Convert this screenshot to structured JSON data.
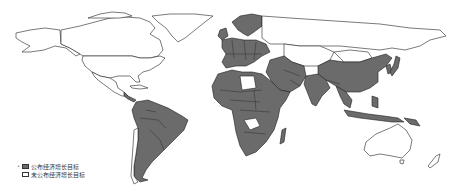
{
  "map": {
    "type": "choropleth-world-map",
    "colors": {
      "announced": "#6b6b6b",
      "not_announced": "#ffffff",
      "border": "#1e1e1e"
    },
    "regions_shaded": [
      "Europe (most countries)",
      "North Africa (except Libya)",
      "Sub-Saharan Africa (most)",
      "Middle East",
      "South Asia (India)",
      "China",
      "Southeast Asia",
      "Japan",
      "South Korea",
      "South America (most, except Chile)",
      "Central America (part)",
      "Madagascar"
    ],
    "regions_unshaded": [
      "Canada",
      "United States",
      "Mexico",
      "Greenland",
      "Russia",
      "Central Asia",
      "Mongolia",
      "Libya",
      "Chile",
      "Australia",
      "New Zealand"
    ]
  },
  "legend": {
    "items": [
      {
        "marker": "•",
        "swatch": "filled",
        "label": "公布经济增长目标"
      },
      {
        "marker": "",
        "swatch": "empty",
        "label": "未公布经济增长目标"
      }
    ]
  }
}
